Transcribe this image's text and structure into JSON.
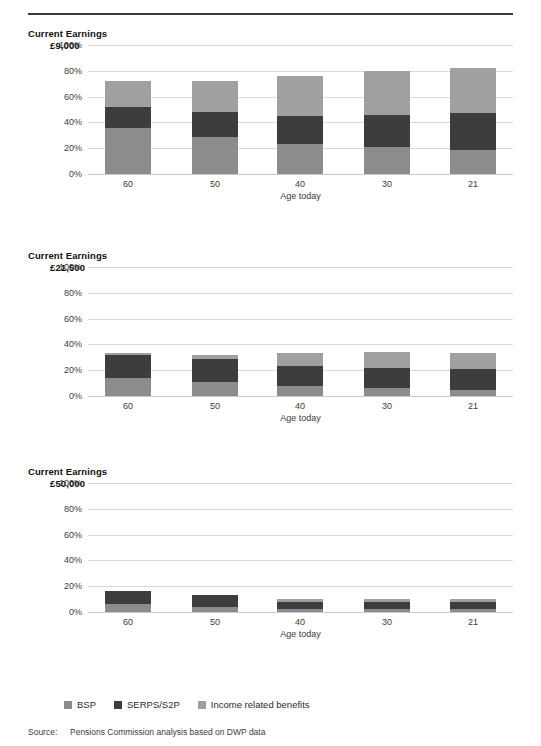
{
  "figure": {
    "source_label": "Source:",
    "source_text": "Pensions Commission analysis based on DWP data"
  },
  "legend": {
    "items": [
      {
        "label": "BSP",
        "color": "#8c8c8c"
      },
      {
        "label": "SERPS/S2P",
        "color": "#3d3d3d"
      },
      {
        "label": "Income related benefits",
        "color": "#a0a0a0"
      }
    ]
  },
  "colors": {
    "bsp": "#8c8c8c",
    "serps": "#3d3d3d",
    "income_related": "#a0a0a0",
    "gridline": "#d9d9d9",
    "rule": "#3a3a3a"
  },
  "chart_data": [
    {
      "type": "bar",
      "stacked": true,
      "title": "Current Earnings",
      "subtitle": "£9,000",
      "xlabel": "Age today",
      "ylabel": "",
      "categories": [
        "60",
        "50",
        "40",
        "30",
        "21"
      ],
      "yticks": [
        "0%",
        "20%",
        "40%",
        "60%",
        "80%",
        "100%"
      ],
      "ytick_values": [
        0,
        20,
        40,
        60,
        80,
        100
      ],
      "ylim": [
        0,
        100
      ],
      "grid": true,
      "legend_position": "bottom",
      "series": [
        {
          "name": "BSP",
          "values": [
            36,
            29,
            23,
            21,
            19
          ]
        },
        {
          "name": "SERPS/S2P",
          "values": [
            16,
            19,
            22,
            25,
            28
          ]
        },
        {
          "name": "Income related benefits",
          "values": [
            20,
            24,
            31,
            34,
            35
          ]
        }
      ],
      "totals": [
        72,
        72,
        76,
        80,
        82
      ]
    },
    {
      "type": "bar",
      "stacked": true,
      "title": "Current Earnings",
      "subtitle": "£21,500",
      "xlabel": "Age today",
      "ylabel": "",
      "categories": [
        "60",
        "50",
        "40",
        "30",
        "21"
      ],
      "yticks": [
        "0%",
        "20%",
        "40%",
        "60%",
        "80%",
        "100%"
      ],
      "ytick_values": [
        0,
        20,
        40,
        60,
        80,
        100
      ],
      "ylim": [
        0,
        100
      ],
      "grid": true,
      "legend_position": "bottom",
      "series": [
        {
          "name": "BSP",
          "values": [
            14,
            11,
            8,
            6,
            5
          ]
        },
        {
          "name": "SERPS/S2P",
          "values": [
            18,
            18,
            15,
            16,
            16
          ]
        },
        {
          "name": "Income related benefits",
          "values": [
            1,
            3,
            10,
            12,
            12
          ]
        }
      ],
      "totals": [
        33,
        32,
        33,
        34,
        33
      ]
    },
    {
      "type": "bar",
      "stacked": true,
      "title": "Current Earnings",
      "subtitle": "£50,000",
      "xlabel": "Age today",
      "ylabel": "",
      "categories": [
        "60",
        "50",
        "40",
        "30",
        "21"
      ],
      "yticks": [
        "0%",
        "20%",
        "40%",
        "60%",
        "80%",
        "100%"
      ],
      "ytick_values": [
        0,
        20,
        40,
        60,
        80,
        100
      ],
      "ylim": [
        0,
        100
      ],
      "grid": true,
      "legend_position": "bottom",
      "series": [
        {
          "name": "BSP",
          "values": [
            6,
            4,
            2,
            2,
            2
          ]
        },
        {
          "name": "SERPS/S2P",
          "values": [
            10,
            9,
            6,
            6,
            6
          ]
        },
        {
          "name": "Income related benefits",
          "values": [
            0,
            0,
            2,
            2,
            2
          ]
        }
      ],
      "totals": [
        16,
        13,
        10,
        10,
        10
      ]
    }
  ]
}
